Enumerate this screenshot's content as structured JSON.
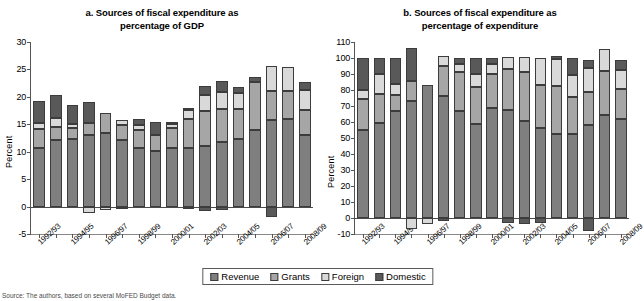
{
  "legend": {
    "position": "bottom-center",
    "items": [
      {
        "label": "Revenue",
        "color": "#7f7f7f"
      },
      {
        "label": "Grants",
        "color": "#a6a6a6"
      },
      {
        "label": "Foreign",
        "color": "#d9d9d9"
      },
      {
        "label": "Domestic",
        "color": "#595959"
      }
    ]
  },
  "source_note": "Source: The authors, based on several MoFED Budget data.",
  "chart_data": [
    {
      "id": "panel-a",
      "type": "bar",
      "stacked": true,
      "title": "a. Sources of fiscal expenditure as percentage of GDP",
      "title_line1": "a. Sources of fiscal expenditure as",
      "title_line2": "percentage of GDP",
      "xlabel": "",
      "ylabel": "Percent",
      "ylim": [
        -5,
        30
      ],
      "yticks": [
        -5,
        0,
        5,
        10,
        15,
        20,
        25,
        30
      ],
      "grid": false,
      "categories": [
        "1992/93",
        "1993/94",
        "1994/95",
        "1995/96",
        "1996/97",
        "1997/98",
        "1998/99",
        "1999/00",
        "2000/01",
        "2001/02",
        "2002/03",
        "2003/04",
        "2004/05",
        "2005/06",
        "2006/07",
        "2007/08",
        "2008/09"
      ],
      "tick_labels": [
        "1992/93",
        "",
        "1994/95",
        "",
        "1996/97",
        "",
        "1998/99",
        "",
        "2000/01",
        "",
        "2002/03",
        "",
        "2004/05",
        "",
        "2006/07",
        "",
        "2008/09"
      ],
      "series": [
        {
          "name": "Revenue",
          "color": "#7f7f7f",
          "values": [
            10.6,
            12.1,
            12.4,
            13.1,
            13.4,
            12.1,
            10.7,
            10.1,
            10.6,
            10.6,
            11.0,
            11.8,
            12.4,
            14.0,
            15.8,
            15.9,
            13.0
          ]
        },
        {
          "name": "Grants",
          "color": "#a6a6a6",
          "values": [
            3.6,
            2.4,
            2.0,
            2.1,
            3.6,
            2.8,
            3.2,
            2.9,
            3.8,
            5.4,
            6.5,
            5.9,
            5.3,
            8.7,
            5.3,
            5.2,
            4.6
          ]
        },
        {
          "name": "Foreign",
          "color": "#d9d9d9",
          "values": [
            1.1,
            1.7,
            0.7,
            0.0,
            0.0,
            0.8,
            0.9,
            0.0,
            0.6,
            1.6,
            2.8,
            3.2,
            3.0,
            0.0,
            4.5,
            4.4,
            3.6
          ]
        },
        {
          "name": "Domestic",
          "color": "#595959",
          "values": [
            3.9,
            4.1,
            3.5,
            3.9,
            0.0,
            0.0,
            1.2,
            2.4,
            0.4,
            0.3,
            1.6,
            2.0,
            1.1,
            0.9,
            0.0,
            0.0,
            1.5
          ]
        }
      ],
      "negative_values": {
        "Foreign": {
          "1995/96": -1.2,
          "1996/97": -0.6
        },
        "Domestic": {
          "1997/98": -0.3,
          "2001/02": -0.5,
          "2002/03": -0.8,
          "2003/04": -0.6,
          "2006/07": -1.9
        }
      },
      "bar_totals": [
        19.2,
        20.3,
        18.6,
        19.1,
        17.0,
        15.7,
        16.0,
        15.4,
        15.4,
        17.9,
        19.6,
        22.0,
        23.2,
        23.6,
        25.6,
        25.5,
        22.7
      ]
    },
    {
      "id": "panel-b",
      "type": "bar",
      "stacked": true,
      "title": "b. Sources of fiscal expenditure as percentage of expenditure",
      "title_line1": "b. Sources of fiscal expenditure as",
      "title_line2": "percentage of expenditure",
      "xlabel": "",
      "ylabel": "Percent",
      "ylim": [
        -10,
        110
      ],
      "yticks": [
        -10,
        0,
        10,
        20,
        30,
        40,
        50,
        60,
        70,
        80,
        90,
        100,
        110
      ],
      "grid": false,
      "categories": [
        "1992/93",
        "1993/94",
        "1994/95",
        "1995/96",
        "1996/97",
        "1997/98",
        "1998/99",
        "1999/00",
        "2000/01",
        "2001/02",
        "2002/03",
        "2003/04",
        "2004/05",
        "2005/06",
        "2006/07",
        "2007/08",
        "2008/09"
      ],
      "tick_labels": [
        "1992/93",
        "",
        "1994/95",
        "",
        "1996/97",
        "",
        "1998/99",
        "",
        "2000/01",
        "",
        "2002/03",
        "",
        "2004/05",
        "",
        "2006/07",
        "",
        "2008/09"
      ],
      "series": [
        {
          "name": "Revenue",
          "color": "#7f7f7f",
          "values": [
            55.0,
            59.5,
            66.8,
            73.0,
            83.3,
            76.0,
            66.8,
            58.6,
            69.0,
            67.8,
            60.7,
            56.5,
            52.3,
            52.8,
            58.2,
            64.4,
            61.7
          ]
        },
        {
          "name": "Grants",
          "color": "#a6a6a6",
          "values": [
            19.5,
            18.0,
            10.2,
            12.4,
            0.0,
            19.0,
            24.5,
            23.5,
            21.0,
            25.2,
            30.3,
            26.8,
            30.5,
            23.0,
            20.5,
            27.6,
            19.2
          ]
        },
        {
          "name": "Foreign",
          "color": "#d9d9d9",
          "values": [
            5.7,
            12.3,
            6.8,
            0.0,
            0.0,
            6.0,
            4.8,
            7.8,
            6.5,
            7.5,
            9.5,
            16.9,
            16.3,
            13.3,
            14.9,
            13.4,
            11.3
          ]
        },
        {
          "name": "Domestic",
          "color": "#595959",
          "values": [
            19.8,
            10.2,
            16.2,
            20.8,
            0.0,
            0.0,
            3.8,
            10.1,
            3.5,
            0.0,
            0.0,
            0.0,
            2.1,
            10.6,
            5.4,
            0.0,
            6.8
          ]
        }
      ],
      "negative_values": {
        "Foreign": {
          "1995/96": -7.0,
          "1996/97": -3.5
        },
        "Domestic": {
          "1997/98": -2.0,
          "2001/02": -3.2,
          "2002/03": -3.5,
          "2003/04": -3.0,
          "2006/07": -8.0
        }
      },
      "bar_totals": [
        100.0,
        100.0,
        100.0,
        106.2,
        105.3,
        101.0,
        99.5,
        99.0,
        100.5,
        100.5,
        100.5,
        100.2,
        101.2,
        99.7,
        99.0,
        105.4,
        99.0
      ]
    }
  ]
}
